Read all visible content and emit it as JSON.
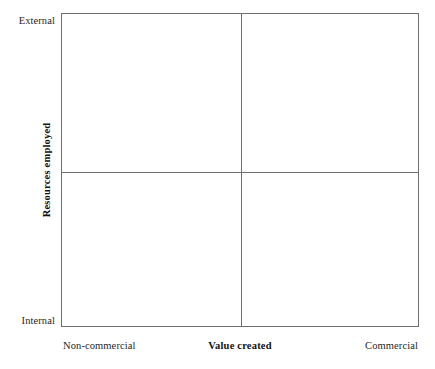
{
  "figure": {
    "type": "quadrant-matrix",
    "background_color": "#ffffff",
    "line_color": "#6e6e6e"
  },
  "chart_data": {
    "type": "scatter",
    "title": "",
    "subtitle": "",
    "xlabel": "Value created",
    "ylabel": "Resources employed",
    "x_tick_labels": [
      "Non-commercial",
      "Commercial"
    ],
    "y_tick_labels": [
      "Internal",
      "External"
    ],
    "xlim": [
      0,
      1
    ],
    "ylim": [
      0,
      1
    ],
    "grid": false,
    "legend": false,
    "legend_position": "none",
    "series": [],
    "annotations": [],
    "quadrants": [
      {
        "position": "top-left",
        "x_level": "Non-commercial",
        "y_level": "External",
        "label": ""
      },
      {
        "position": "top-right",
        "x_level": "Commercial",
        "y_level": "External",
        "label": ""
      },
      {
        "position": "bottom-left",
        "x_level": "Non-commercial",
        "y_level": "Internal",
        "label": ""
      },
      {
        "position": "bottom-right",
        "x_level": "Commercial",
        "y_level": "Internal",
        "label": ""
      }
    ],
    "divider_x": 0.5,
    "divider_y": 0.5
  },
  "axes": {
    "y": {
      "title": "Resources employed",
      "top_label": "External",
      "bottom_label": "Internal"
    },
    "x": {
      "title": "Value created",
      "left_label": "Non-commercial",
      "right_label": "Commercial"
    }
  }
}
